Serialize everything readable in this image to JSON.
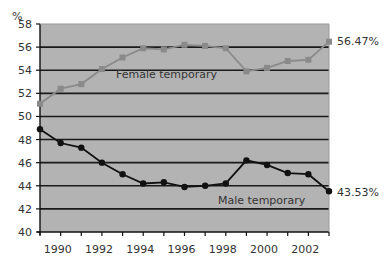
{
  "chart_data": {
    "type": "line",
    "title": "",
    "xlabel": "",
    "ylabel": "%",
    "ylim": [
      40,
      58
    ],
    "yticks": [
      40,
      42,
      44,
      46,
      48,
      50,
      52,
      54,
      56,
      58
    ],
    "xticks_labeled": [
      "1990",
      "1992",
      "1994",
      "1996",
      "1998",
      "2000",
      "2002"
    ],
    "x": [
      1989,
      1990,
      1991,
      1992,
      1993,
      1994,
      1995,
      1996,
      1997,
      1998,
      1999,
      2000,
      2001,
      2002,
      2003
    ],
    "grid": true,
    "legend": "inline labels",
    "series": [
      {
        "name": "Female temporary",
        "color": "#888888",
        "marker": "square",
        "values": [
          51.1,
          52.4,
          52.8,
          54.1,
          55.1,
          55.9,
          55.8,
          56.2,
          56.1,
          55.9,
          53.9,
          54.2,
          54.8,
          54.9,
          56.47
        ],
        "end_label": "56.47%"
      },
      {
        "name": "Male temporary",
        "color": "#111111",
        "marker": "diamond",
        "values": [
          48.9,
          47.7,
          47.3,
          46.0,
          45.0,
          44.2,
          44.3,
          43.9,
          44.0,
          44.2,
          46.2,
          45.8,
          45.1,
          45.0,
          43.53
        ],
        "end_label": "43.53%"
      }
    ],
    "annotations": [
      "Female temporary",
      "Male temporary",
      "56.47%",
      "43.53%"
    ]
  },
  "labels": {
    "y_unit": "%",
    "female": "Female temporary",
    "male": "Male temporary",
    "female_end": "56.47%",
    "male_end": "43.53%"
  },
  "colors": {
    "plot_bg": "#b3b3b3",
    "grid": "#1a1a1a",
    "female_line": "#8a8a8a",
    "male_line": "#111111"
  }
}
